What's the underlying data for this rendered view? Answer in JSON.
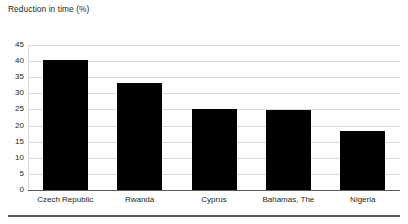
{
  "chart_data": {
    "type": "bar",
    "title": "Reduction in time (%)",
    "xlabel": "",
    "ylabel": "",
    "categories": [
      "Czech Republic",
      "Rwanda",
      "Cyprus",
      "Bahamas, The",
      "Nigeria"
    ],
    "values": [
      40.3,
      33.3,
      25.2,
      24.7,
      18.3
    ],
    "ylim": [
      0,
      45
    ],
    "yticks": [
      45,
      40,
      35,
      30,
      25,
      20,
      15,
      10,
      5,
      0
    ],
    "ytick_labels": [
      "45",
      "40",
      "35",
      "30",
      "25",
      "20",
      "15",
      "10",
      "5",
      "0"
    ],
    "grid": true,
    "legend": false,
    "bar_color": "#000000",
    "grid_color": "#d9d9d9",
    "axis_color": "#58595b",
    "text_color": "#231f20"
  }
}
